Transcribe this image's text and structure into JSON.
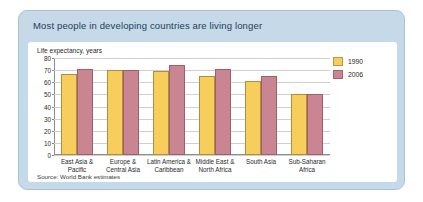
{
  "figure": {
    "title": "Most people in developing countries are living longer",
    "source": "Source: World Bank estimates"
  },
  "chart_data": {
    "type": "bar",
    "title": "Most people in developing countries are living longer",
    "ylabel": "Life expectancy, years",
    "xlabel": "",
    "ylim": [
      0,
      80
    ],
    "yticks": [
      0,
      10,
      20,
      30,
      40,
      50,
      60,
      70,
      80
    ],
    "grid": true,
    "legend_position": "top-right",
    "source": "Source: World Bank estimates",
    "categories": [
      "East Asia & Pacific",
      "Europe & Central Asia",
      "Latin America & Caribbean",
      "Middle East & North Africa",
      "South Asia",
      "Sub-Saharan Africa"
    ],
    "category_lines": [
      [
        "East Asia &",
        "Pacific"
      ],
      [
        "Europe &",
        "Central Asia"
      ],
      [
        "Latin America &",
        "Caribbean"
      ],
      [
        "Middle East &",
        "North Africa"
      ],
      [
        "South Asia",
        ""
      ],
      [
        "Sub-Saharan",
        "Africa"
      ]
    ],
    "series": [
      {
        "name": "1990",
        "color": "#f7ce5b",
        "values": [
          67,
          70,
          69,
          65,
          61,
          50
        ]
      },
      {
        "name": "2006",
        "color": "#c98591",
        "values": [
          71,
          70,
          74,
          71,
          65,
          50
        ]
      }
    ]
  },
  "colors": {
    "header_band": "#c5d9e8",
    "title_text": "#1d3c5c",
    "series_1990": "#f7ce5b",
    "series_2006": "#c98591",
    "plot_background": "#ffffff"
  }
}
